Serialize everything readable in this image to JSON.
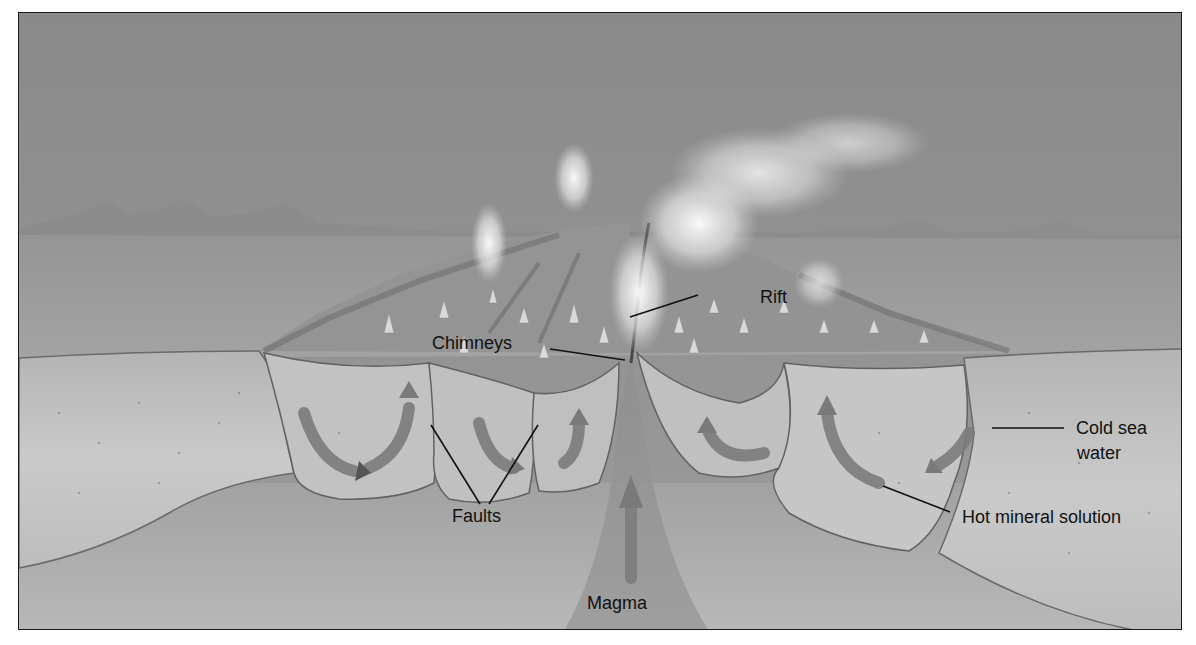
{
  "diagram": {
    "style": "grayscale painted illustration",
    "labels": {
      "rift": "Rift",
      "chimneys": "Chimneys",
      "faults": "Faults",
      "cold_sea_water": "Cold sea water",
      "cold_sea_water_line1": "Cold sea",
      "cold_sea_water_line2": "water",
      "hot_mineral_solution": "Hot mineral solution",
      "magma": "Magma"
    },
    "colors": {
      "sky": "#8e8e8e",
      "seafloor": "#9a9a9a",
      "crust": "#c4c4c4",
      "magma_zone": "#a9a9a9",
      "arrow": "#777777",
      "plume": "#f2f2f2",
      "label_text": "#111111",
      "frame": "#1a1a1a"
    }
  }
}
